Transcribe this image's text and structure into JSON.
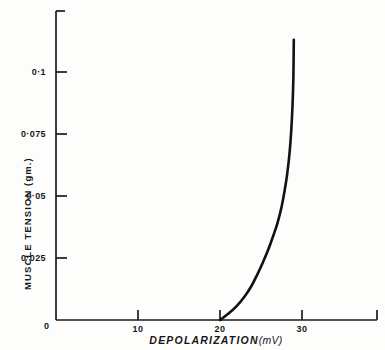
{
  "figure": {
    "background_color": "#fdfdfb",
    "axis_color": "#1a1b1d",
    "curve_color": "#111111"
  },
  "axes": {
    "y_title_main": "MUSCLE TENSION",
    "y_title_unit": "(gm.)",
    "y_title_full": "MUSCLE TENSION (gm.)",
    "x_title_main": "DEPOLARIZATION",
    "x_title_unit": "(mV)",
    "origin_label": "0"
  },
  "y_ticks": [
    {
      "label": "0·1",
      "value": 0.1
    },
    {
      "label": "0·075",
      "value": 0.075
    },
    {
      "label": "0·05",
      "value": 0.05
    },
    {
      "label": "0·025",
      "value": 0.025
    }
  ],
  "x_ticks": [
    {
      "label": "10",
      "value": 10
    },
    {
      "label": "20",
      "value": 20
    },
    {
      "label": "30",
      "value": 30
    }
  ],
  "chart_data": {
    "type": "line",
    "title": "",
    "xlabel": "DEPOLARIZATION (mV)",
    "ylabel": "MUSCLE TENSION (gm.)",
    "xlim": [
      0,
      38
    ],
    "ylim": [
      0,
      0.125
    ],
    "grid": false,
    "legend": null,
    "xticks": [
      10,
      20,
      30
    ],
    "xticklabels": [
      "10",
      "20",
      "30"
    ],
    "yticks": [
      0.025,
      0.05,
      0.075,
      0.1
    ],
    "yticklabels": [
      "0·025",
      "0·05",
      "0·075",
      "0·1"
    ],
    "series": [
      {
        "name": "Muscle tension",
        "x": [
          20.0,
          21.0,
          22.0,
          23.0,
          23.8,
          24.5,
          25.2,
          25.9,
          26.5,
          27.0,
          27.5,
          27.9,
          28.2,
          28.5,
          28.7,
          28.85,
          28.95,
          29.0
        ],
        "y": [
          0.0,
          0.0025,
          0.0055,
          0.0095,
          0.0135,
          0.018,
          0.023,
          0.0285,
          0.034,
          0.039,
          0.0455,
          0.0525,
          0.059,
          0.068,
          0.077,
          0.087,
          0.098,
          0.113
        ]
      }
    ]
  }
}
